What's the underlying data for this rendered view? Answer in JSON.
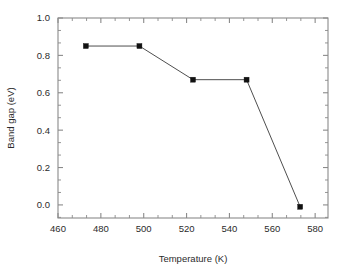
{
  "chart_data": {
    "type": "line",
    "title": "",
    "subtitle": "",
    "xlabel": "Temperature (K)",
    "ylabel": "Band gap (eV)",
    "xlim": [
      460,
      586
    ],
    "ylim": [
      -0.07,
      1.0
    ],
    "xticks": [
      460,
      480,
      500,
      520,
      540,
      560,
      580
    ],
    "yticks": [
      0.0,
      0.2,
      0.4,
      0.6,
      0.8,
      1.0
    ],
    "xtick_labels": [
      "460",
      "480",
      "500",
      "520",
      "540",
      "560",
      "580"
    ],
    "ytick_labels": [
      "0.0",
      "0.2",
      "0.4",
      "0.6",
      "0.8",
      "1.0"
    ],
    "x_minor_ticks_per_interval": 2,
    "y_minor_ticks_per_interval": 2,
    "grid": false,
    "legend": false,
    "legend_position": "none",
    "frame": "box",
    "tick_direction": "in",
    "series": [
      {
        "name": "Band gap",
        "marker": "square",
        "marker_color": "#111111",
        "line_color": "#3a3a3a",
        "x": [
          473,
          498,
          523,
          548,
          573
        ],
        "y": [
          0.85,
          0.85,
          0.67,
          0.67,
          -0.01
        ],
        "points": [
          {
            "x": 473,
            "y": 0.85
          },
          {
            "x": 498,
            "y": 0.85
          },
          {
            "x": 523,
            "y": 0.67
          },
          {
            "x": 548,
            "y": 0.67
          },
          {
            "x": 573,
            "y": -0.01
          }
        ]
      }
    ],
    "colors": {
      "axis": "#8a8a8a",
      "text": "#2b2b2b",
      "marker": "#111111",
      "line": "#3a3a3a",
      "background": "#ffffff"
    }
  }
}
